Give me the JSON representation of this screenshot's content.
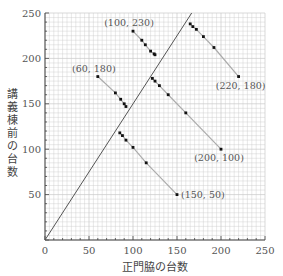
{
  "chart_data": {
    "type": "scatter",
    "title": "",
    "xlabel": "正門脇の台数",
    "ylabel": "講義棟前の台数",
    "xlim": [
      0,
      250
    ],
    "ylim": [
      0,
      250
    ],
    "xticks": [
      0,
      50,
      100,
      150,
      200,
      250
    ],
    "yticks": [
      50,
      100,
      150,
      200,
      250
    ],
    "grid": true,
    "grid_minor_step": 5,
    "reference_line": {
      "from": [
        0,
        0
      ],
      "to": [
        166.7,
        250
      ],
      "slope": 1.5
    },
    "series": [
      {
        "name": "from (60,180)",
        "start": [
          60,
          180
        ],
        "end": [
          150,
          50
        ],
        "points": [
          [
            60,
            180
          ],
          [
            80,
            162
          ],
          [
            86,
            155
          ],
          [
            90,
            150
          ],
          [
            92,
            147
          ],
          [
            85,
            118
          ],
          [
            88,
            115
          ],
          [
            92,
            110
          ],
          [
            100,
            102
          ],
          [
            115,
            85
          ],
          [
            150,
            50
          ]
        ]
      },
      {
        "name": "from (100,230)",
        "start": [
          100,
          230
        ],
        "end": [
          200,
          100
        ],
        "points": [
          [
            100,
            230
          ],
          [
            110,
            220
          ],
          [
            114,
            215
          ],
          [
            120,
            208
          ],
          [
            124,
            205
          ],
          [
            125,
            204
          ],
          [
            122,
            178
          ],
          [
            125,
            175
          ],
          [
            130,
            170
          ],
          [
            140,
            160
          ],
          [
            160,
            140
          ],
          [
            200,
            100
          ]
        ]
      },
      {
        "name": "from (220,180)",
        "start": [
          220,
          180
        ],
        "end": [
          165,
          238
        ],
        "points": [
          [
            220,
            180
          ],
          [
            192,
            212
          ],
          [
            180,
            224
          ],
          [
            172,
            232
          ],
          [
            168,
            235
          ],
          [
            165,
            238
          ]
        ]
      }
    ],
    "annotations": [
      {
        "text": "(100, 230)",
        "at": [
          100,
          230
        ]
      },
      {
        "text": "(60, 180)",
        "at": [
          60,
          180
        ]
      },
      {
        "text": "(220, 180)",
        "at": [
          220,
          180
        ]
      },
      {
        "text": "(200, 100)",
        "at": [
          200,
          100
        ]
      },
      {
        "text": "(150, 50)",
        "at": [
          150,
          50
        ]
      }
    ],
    "colors": {
      "grid": "#c8c8c8",
      "axis": "#444444",
      "line": "#555555",
      "segment": "#aaaaaa",
      "point": "#111111"
    }
  }
}
